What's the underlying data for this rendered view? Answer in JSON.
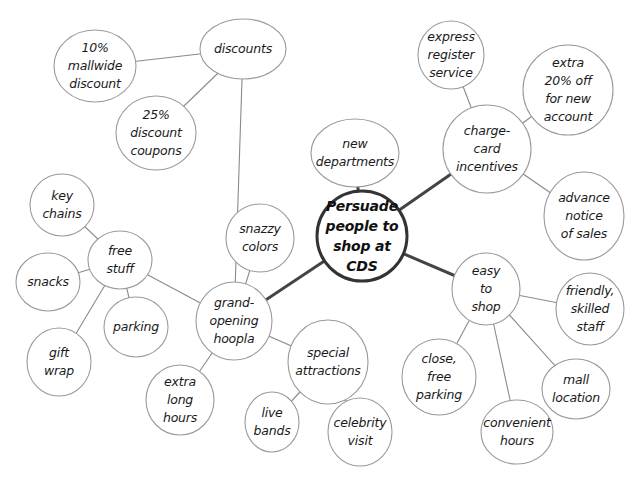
{
  "diagram": {
    "type": "mind-map",
    "center": {
      "id": "center",
      "label": "Persuade\npeople to\nshop at CDS"
    },
    "nodes": [
      {
        "id": "center",
        "label": "Persuade\npeople to\nshop at CDS",
        "cx": 362,
        "cy": 236,
        "rx": 45,
        "ry": 45
      },
      {
        "id": "new-departments",
        "label": "new\ndepartments",
        "cx": 355,
        "cy": 153,
        "rx": 44,
        "ry": 34
      },
      {
        "id": "charge-card-incentives",
        "label": "charge-\ncard\nincentives",
        "cx": 487,
        "cy": 149,
        "rx": 44,
        "ry": 44
      },
      {
        "id": "express-register-service",
        "label": "express\nregister\nservice",
        "cx": 451,
        "cy": 55,
        "rx": 33,
        "ry": 34
      },
      {
        "id": "extra-20-off",
        "label": "extra\n20% off\nfor new\naccount",
        "cx": 568,
        "cy": 90,
        "rx": 45,
        "ry": 45
      },
      {
        "id": "advance-notice",
        "label": "advance\nnotice\nof sales",
        "cx": 584,
        "cy": 216,
        "rx": 40,
        "ry": 44
      },
      {
        "id": "easy-to-shop",
        "label": "easy\nto\nshop",
        "cx": 486,
        "cy": 289,
        "rx": 34,
        "ry": 36
      },
      {
        "id": "friendly-staff",
        "label": "friendly,\nskilled\nstaff",
        "cx": 590,
        "cy": 309,
        "rx": 34,
        "ry": 36
      },
      {
        "id": "close-free-parking",
        "label": "close,\nfree\nparking",
        "cx": 439,
        "cy": 377,
        "rx": 37,
        "ry": 38
      },
      {
        "id": "mall-location",
        "label": "mall\nlocation",
        "cx": 576,
        "cy": 389,
        "rx": 34,
        "ry": 30
      },
      {
        "id": "convenient-hours",
        "label": "convenient\nhours",
        "cx": 517,
        "cy": 432,
        "rx": 36,
        "ry": 32
      },
      {
        "id": "grand-opening-hoopla",
        "label": "grand-\nopening\nhoopla",
        "cx": 234,
        "cy": 321,
        "rx": 38,
        "ry": 39
      },
      {
        "id": "snazzy-colors",
        "label": "snazzy\ncolors",
        "cx": 260,
        "cy": 238,
        "rx": 34,
        "ry": 34
      },
      {
        "id": "discounts",
        "label": "discounts",
        "cx": 243,
        "cy": 49,
        "rx": 43,
        "ry": 30
      },
      {
        "id": "mallwide-discount",
        "label": "10%\nmallwide\ndiscount",
        "cx": 95,
        "cy": 66,
        "rx": 41,
        "ry": 36
      },
      {
        "id": "discount-coupons",
        "label": "25%\ndiscount\ncoupons",
        "cx": 156,
        "cy": 133,
        "rx": 40,
        "ry": 37
      },
      {
        "id": "free-stuff",
        "label": "free\nstuff",
        "cx": 120,
        "cy": 260,
        "rx": 32,
        "ry": 29
      },
      {
        "id": "key-chains",
        "label": "key\nchains",
        "cx": 62,
        "cy": 205,
        "rx": 32,
        "ry": 31
      },
      {
        "id": "snacks",
        "label": "snacks",
        "cx": 48,
        "cy": 282,
        "rx": 32,
        "ry": 29
      },
      {
        "id": "parking",
        "label": "parking",
        "cx": 136,
        "cy": 327,
        "rx": 32,
        "ry": 30
      },
      {
        "id": "gift-wrap",
        "label": "gift\nwrap",
        "cx": 59,
        "cy": 362,
        "rx": 32,
        "ry": 34
      },
      {
        "id": "special-attractions",
        "label": "special\nattractions",
        "cx": 328,
        "cy": 362,
        "rx": 40,
        "ry": 42
      },
      {
        "id": "extra-long-hours",
        "label": "extra\nlong\nhours",
        "cx": 180,
        "cy": 400,
        "rx": 34,
        "ry": 35
      },
      {
        "id": "live-bands",
        "label": "live\nbands",
        "cx": 272,
        "cy": 422,
        "rx": 27,
        "ry": 30
      },
      {
        "id": "celebrity-visit",
        "label": "celebrity\nvisit",
        "cx": 360,
        "cy": 432,
        "rx": 32,
        "ry": 34
      }
    ],
    "edges": [
      {
        "from": "center",
        "to": "new-departments",
        "main": true
      },
      {
        "from": "center",
        "to": "charge-card-incentives",
        "main": true
      },
      {
        "from": "center",
        "to": "easy-to-shop",
        "main": true
      },
      {
        "from": "center",
        "to": "grand-opening-hoopla",
        "main": true
      },
      {
        "from": "charge-card-incentives",
        "to": "express-register-service",
        "main": false
      },
      {
        "from": "charge-card-incentives",
        "to": "extra-20-off",
        "main": false
      },
      {
        "from": "charge-card-incentives",
        "to": "advance-notice",
        "main": false
      },
      {
        "from": "easy-to-shop",
        "to": "friendly-staff",
        "main": false
      },
      {
        "from": "easy-to-shop",
        "to": "close-free-parking",
        "main": false
      },
      {
        "from": "easy-to-shop",
        "to": "mall-location",
        "main": false
      },
      {
        "from": "easy-to-shop",
        "to": "convenient-hours",
        "main": false
      },
      {
        "from": "grand-opening-hoopla",
        "to": "snazzy-colors",
        "main": false
      },
      {
        "from": "grand-opening-hoopla",
        "to": "discounts",
        "main": false
      },
      {
        "from": "grand-opening-hoopla",
        "to": "free-stuff",
        "main": false
      },
      {
        "from": "grand-opening-hoopla",
        "to": "special-attractions",
        "main": false
      },
      {
        "from": "grand-opening-hoopla",
        "to": "extra-long-hours",
        "main": false
      },
      {
        "from": "discounts",
        "to": "mallwide-discount",
        "main": false
      },
      {
        "from": "discounts",
        "to": "discount-coupons",
        "main": false
      },
      {
        "from": "free-stuff",
        "to": "key-chains",
        "main": false
      },
      {
        "from": "free-stuff",
        "to": "snacks",
        "main": false
      },
      {
        "from": "free-stuff",
        "to": "parking",
        "main": false
      },
      {
        "from": "free-stuff",
        "to": "gift-wrap",
        "main": false
      },
      {
        "from": "special-attractions",
        "to": "live-bands",
        "main": false
      },
      {
        "from": "special-attractions",
        "to": "celebrity-visit",
        "main": false
      }
    ],
    "colors": {
      "background": "#ffffff",
      "main_edge": "#444444",
      "sub_edge": "#8a8a8a",
      "center_border": "#333333",
      "node_border": "#9a9a9a",
      "text": "#1a1a1a"
    }
  }
}
